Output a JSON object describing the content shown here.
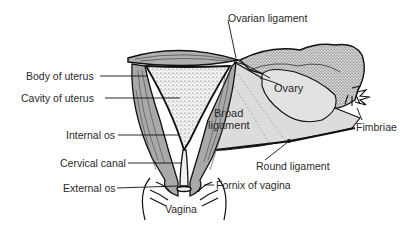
{
  "diagram": {
    "colors": {
      "muscle": "#a9a9a9",
      "stipple": "#e6e6e6",
      "ligament": "#d9d9d9",
      "outline": "#1a1a1a",
      "text": "#2a2a2a",
      "background": "#ffffff"
    },
    "labels": {
      "ovarian_ligament": "Ovarian ligament",
      "body_of_uterus": "Body of uterus",
      "ovary": "Ovary",
      "cavity_of_uterus": "Cavity of uterus",
      "broad_ligament_line1": "Broad",
      "broad_ligament_line2": "ligament",
      "fimbriae": "Fimbriae",
      "internal_os": "Internal os",
      "cervical_canal": "Cervical canal",
      "round_ligament": "Round ligament",
      "external_os": "External os",
      "fornix_of_vagina": "Fornix of vagina",
      "vagina": "Vagina"
    }
  }
}
